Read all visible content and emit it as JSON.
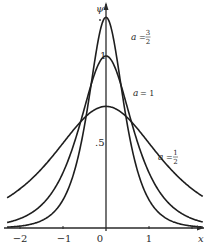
{
  "chart_data": {
    "type": "line",
    "title": "",
    "xlabel": "x",
    "ylabel": "ψ",
    "xlim": [
      -2.3,
      2.25
    ],
    "ylim": [
      0,
      1.32
    ],
    "x_ticks": [
      -2,
      -1,
      0,
      1,
      2
    ],
    "x_tick_labels": [
      "−2",
      "−1",
      "0",
      "1",
      ""
    ],
    "y_tick_labels": [
      {
        "value": 1,
        "label": "1"
      },
      {
        "value": 0.5,
        "label": ".5"
      }
    ],
    "grid": false,
    "legend": "none (curves labeled inline)",
    "function": "psi = sqrt(a) * sech(k * a * x)",
    "k_estimate": 1.8,
    "series": [
      {
        "name": "a = 3/2",
        "a": 1.5,
        "label_var": "a",
        "label_num": "3",
        "label_den": "2",
        "peak": 1.22
      },
      {
        "name": "a = 1",
        "a": 1.0,
        "label_var": "a",
        "label_text": "= 1",
        "peak": 1.0
      },
      {
        "name": "a = 1/2",
        "a": 0.5,
        "label_var": "a",
        "label_num": "1",
        "label_den": "2",
        "peak": 0.71
      }
    ],
    "colors": {
      "curve": "#1e1e1e",
      "axis": "#2a2a2a",
      "background": "#ffffff"
    }
  }
}
